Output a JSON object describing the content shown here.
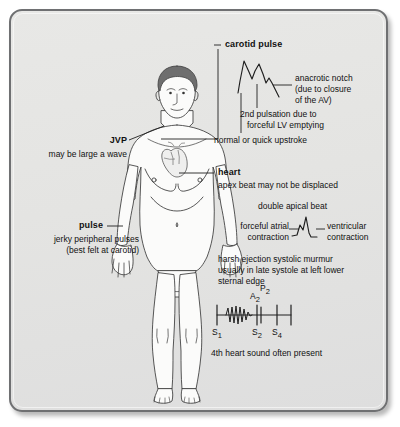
{
  "diagram": {
    "panel_bg": "#e5e5e3",
    "border_color": "#6f7072",
    "ink": "#111111"
  },
  "annotations": {
    "carotid": {
      "label": "carotid pulse",
      "notch_line1": "anacrotic notch",
      "notch_line2": "(due to closure",
      "notch_line3": "of the AV)",
      "second_pulsation_line1": "2nd pulsation due to",
      "second_pulsation_line2": "forceful LV emptying",
      "upstroke": "normal or quick upstroke"
    },
    "jvp": {
      "label": "JVP",
      "detail": "may be large a wave"
    },
    "heart": {
      "label": "heart",
      "detail": "apex beat may not be displaced",
      "double_apical": "double apical beat",
      "atrial_line1": "forceful atrial",
      "atrial_line2": "contraction",
      "ventricular_line1": "ventricular",
      "ventricular_line2": "contraction",
      "murmur_line1": "harsh ejection systolic murmur",
      "murmur_line2": "usually in late systole at left lower",
      "murmur_line3": "sternal edge"
    },
    "pulse": {
      "label": "pulse",
      "detail_line1": "jerky peripheral pulses",
      "detail_line2": "(best felt at carotid)"
    },
    "phono": {
      "s1": "S",
      "s1_sub": "1",
      "s2": "S",
      "s2_sub": "2",
      "s4": "S",
      "s4_sub": "4",
      "a2": "A",
      "a2_sub": "2",
      "p2": "P",
      "p2_sub": "2",
      "caption": "4th heart sound often present"
    }
  }
}
